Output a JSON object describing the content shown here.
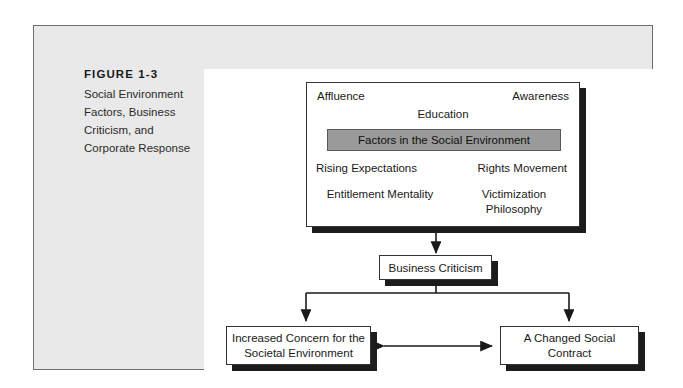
{
  "figure": {
    "label": "FIGURE 1-3",
    "title": "Social Environment Factors, Business Criticism, and Corporate Response"
  },
  "diagram": {
    "type": "flowchart",
    "social_environment": {
      "corner_labels": {
        "top_left": "Affluence",
        "top_right": "Awareness",
        "top_center": "Education"
      },
      "highlight_bar": {
        "text": "Factors in the Social Environment",
        "fill": "#9a9a9a"
      },
      "left_branch": {
        "source": "Rising Expectations",
        "target": "Entitlement Mentality"
      },
      "right_branch": {
        "source": "Rights Movement",
        "target": "Victimization Philosophy"
      }
    },
    "business_criticism": "Business Criticism",
    "outcomes": [
      "Increased Concern for the Societal Environment",
      "A Changed Social Contract"
    ],
    "colors": {
      "frame_bg": "#e9e9e9",
      "panel_bg": "#ffffff",
      "shadow": "#1c1c1c",
      "stroke": "#333333"
    }
  }
}
